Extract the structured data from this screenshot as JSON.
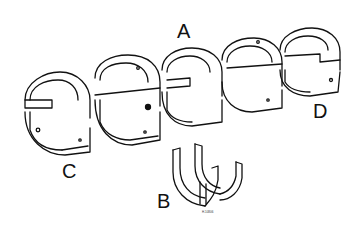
{
  "figure": {
    "labels": [
      {
        "id": "A",
        "text": "A",
        "x": 177,
        "y": 20
      },
      {
        "id": "B",
        "text": "B",
        "x": 157,
        "y": 192
      },
      {
        "id": "C",
        "text": "C",
        "x": 62,
        "y": 160
      },
      {
        "id": "D",
        "text": "D",
        "x": 313,
        "y": 100
      }
    ],
    "reference_number": "H.10806",
    "colors": {
      "line": "#111111",
      "background": "#ffffff"
    }
  }
}
